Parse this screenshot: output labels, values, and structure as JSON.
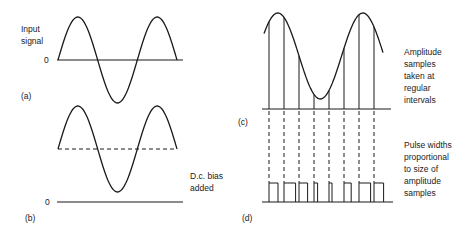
{
  "panels": {
    "a": {
      "tag": "(a)",
      "label_lines": [
        "Input",
        "signal"
      ],
      "zero_label": "0"
    },
    "b": {
      "tag": "(b)",
      "label_lines": [
        "D.c. bias",
        "added"
      ],
      "zero_label": "0"
    },
    "c": {
      "tag": "(c)",
      "label_lines": [
        "Amplitude",
        "samples",
        "taken at",
        "regular",
        "intervals"
      ],
      "sample_count": 8
    },
    "d": {
      "tag": "(d)",
      "label_lines": [
        "Pulse widths",
        "proportional",
        "to size of",
        "amplitude",
        "samples"
      ],
      "pulse_width_fractions": [
        0.75,
        0.97,
        0.72,
        0.3,
        0.25,
        0.6,
        0.97,
        0.8
      ]
    }
  },
  "colors": {
    "stroke": "#1a1a1a",
    "text": "#222222"
  }
}
